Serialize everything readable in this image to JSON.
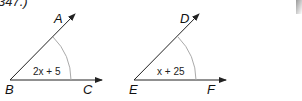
{
  "header": {
    "cutoff_text": "347.)"
  },
  "figures": [
    {
      "vertex": "B",
      "ray_upper_point": "A",
      "ray_lower_point": "C",
      "angle_expression": "2x + 5"
    },
    {
      "vertex": "E",
      "ray_upper_point": "D",
      "ray_lower_point": "F",
      "angle_expression": "x + 25"
    }
  ],
  "colors": {
    "line": "#222222",
    "arc": "#aaaaaa",
    "text": "#111111"
  }
}
